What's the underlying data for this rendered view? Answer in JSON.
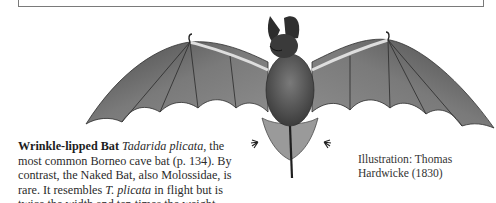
{
  "caption": {
    "title": "Wrinkle-lipped Bat",
    "scientific_name": "Tadarida plicata",
    "text_1": ", the most common Borneo cave bat (p. 134). By contrast, the Naked Bat, also Molossidae, is rare. It resembles ",
    "abbrev_name": "T. plicata",
    "text_2": " in flight but is twice the width and ten times the weight."
  },
  "credit": {
    "line1": "Illustration: Thomas",
    "line2": "Hardwicke (1830)"
  },
  "illustration": {
    "subject": "bat-illustration",
    "colors": {
      "wing": "#6b6b6b",
      "wing_dark": "#3a3a3a",
      "body": "#5a5a5a",
      "bone": "#d9d9d9"
    }
  }
}
